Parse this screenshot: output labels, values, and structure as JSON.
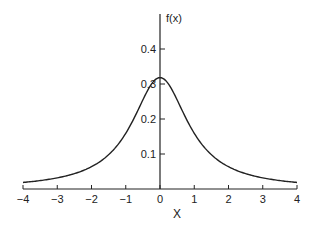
{
  "chart_data": {
    "type": "line",
    "title": "",
    "xlabel": "X",
    "ylabel": "f(x)",
    "xlim": [
      -4,
      4
    ],
    "ylim": [
      0,
      0.45
    ],
    "x_ticks": [
      "-4",
      "-3",
      "-2",
      "-1",
      "0",
      "1",
      "2",
      "3",
      "4"
    ],
    "y_ticks": [
      "0.1",
      "0.2",
      "0.3",
      "0.4"
    ],
    "grid": false,
    "series": [
      {
        "name": "f(x) = 1/(π(1+x²))",
        "x": [
          -4,
          -3,
          -2,
          -1.5,
          -1,
          -0.5,
          0,
          0.5,
          1,
          1.5,
          2,
          3,
          4
        ],
        "y": [
          0.019,
          0.032,
          0.064,
          0.098,
          0.159,
          0.255,
          0.318,
          0.255,
          0.159,
          0.098,
          0.064,
          0.032,
          0.019
        ]
      }
    ]
  }
}
